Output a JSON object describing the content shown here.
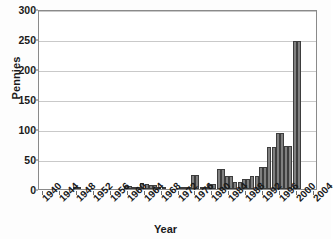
{
  "chart_data": {
    "type": "bar",
    "title": "",
    "xlabel": "Year",
    "ylabel": "Pennies",
    "ylim": [
      0,
      300
    ],
    "ytick_values": [
      0,
      50,
      100,
      150,
      200,
      250,
      300
    ],
    "ytick_labels": [
      "0",
      "50",
      "100",
      "150",
      "200",
      "250",
      "300"
    ],
    "xlim": [
      1939,
      2005
    ],
    "xtick_labels": [
      "1940",
      "1944",
      "1948",
      "1952",
      "1956",
      "1960",
      "1964",
      "1968",
      "1972",
      "1976",
      "1980",
      "1984",
      "1988",
      "1992",
      "1996",
      "2000",
      "2004"
    ],
    "xtick_values": [
      1940,
      1944,
      1948,
      1952,
      1956,
      1960,
      1964,
      1968,
      1972,
      1976,
      1980,
      1984,
      1988,
      1992,
      1996,
      2000,
      2004
    ],
    "grid": "horizontal",
    "legend": "none",
    "bar_color": "#808080",
    "bar_edge_color": "#3d3d3d",
    "axis_color": "#8a8a8a",
    "grid_color": "#c9c9c9",
    "text_color": "#1a1a1a",
    "background_color": "#ffffff",
    "categories": [
      1940,
      1941,
      1942,
      1943,
      1944,
      1945,
      1946,
      1947,
      1948,
      1949,
      1950,
      1951,
      1952,
      1953,
      1954,
      1955,
      1956,
      1957,
      1958,
      1959,
      1960,
      1961,
      1962,
      1963,
      1964,
      1965,
      1966,
      1967,
      1968,
      1969,
      1970,
      1971,
      1972,
      1973,
      1974,
      1975,
      1976,
      1977,
      1978,
      1979,
      1980,
      1981,
      1982,
      1983,
      1984,
      1985,
      1986,
      1987,
      1988,
      1989,
      1990,
      1991,
      1992,
      1993,
      1994,
      1995,
      1996,
      1997,
      1998,
      1999,
      2000,
      2001,
      2002,
      2003,
      2004
    ],
    "values": [
      0,
      0,
      0,
      0,
      0,
      0,
      0,
      4,
      4,
      0,
      0,
      0,
      0,
      0,
      0,
      0,
      0,
      0,
      0,
      5,
      5,
      4,
      4,
      10,
      9,
      7,
      6,
      4,
      4,
      0,
      0,
      0,
      4,
      4,
      4,
      23,
      23,
      3,
      3,
      8,
      8,
      33,
      33,
      22,
      22,
      12,
      12,
      17,
      17,
      22,
      22,
      37,
      37,
      70,
      70,
      93,
      93,
      72,
      72,
      246,
      246,
      0,
      0,
      0,
      0
    ]
  }
}
